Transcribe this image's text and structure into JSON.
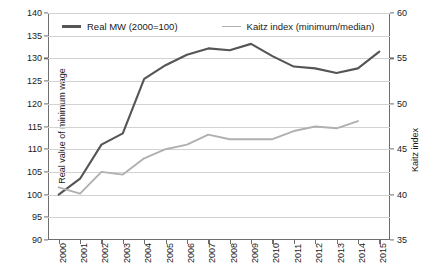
{
  "chart_data": {
    "type": "line",
    "title": "",
    "subtitle": "",
    "xlabel": "",
    "ylabel": "Real value of minimum wage",
    "y2label": "Kaitz index",
    "categories": [
      "2000",
      "2001",
      "2002",
      "2003",
      "2004",
      "2005",
      "2006",
      "2007",
      "2008",
      "2009",
      "2010",
      "2011",
      "2012",
      "2013",
      "2014",
      "2015"
    ],
    "x": [
      2000,
      2001,
      2002,
      2003,
      2004,
      2005,
      2006,
      2007,
      2008,
      2009,
      2010,
      2011,
      2012,
      2013,
      2014,
      2015
    ],
    "ylim": [
      90,
      140
    ],
    "y2lim": [
      35,
      60
    ],
    "yticks": [
      90,
      95,
      100,
      105,
      110,
      115,
      120,
      125,
      130,
      135,
      140
    ],
    "y2ticks": [
      35,
      40,
      45,
      50,
      55,
      60
    ],
    "grid": true,
    "legend_position": "top-inside",
    "series": [
      {
        "name": "Real MW (2000=100)",
        "axis": "left",
        "color": "#555555",
        "values": [
          100.0,
          103.5,
          111.0,
          113.5,
          125.5,
          128.5,
          130.8,
          132.2,
          131.8,
          133.2,
          130.5,
          128.2,
          127.8,
          126.8,
          127.8,
          131.5
        ]
      },
      {
        "name": "Kaitz index (minimum/median)",
        "axis": "right",
        "color": "#b0b0b0",
        "values": [
          40.8,
          40.1,
          42.5,
          42.2,
          44.0,
          45.0,
          45.5,
          46.6,
          46.1,
          46.1,
          46.1,
          47.0,
          47.5,
          47.3,
          48.1,
          null
        ]
      }
    ]
  },
  "legend": {
    "items": [
      {
        "label": "Real MW (2000=100)",
        "color": "#555555",
        "swatch": "thick-line-swatch"
      },
      {
        "label": "Kaitz index (minimum/median)",
        "color": "#b0b0b0",
        "swatch": "thin-line-swatch"
      }
    ]
  },
  "colors": {
    "real_mw_line": "#555555",
    "kaitz_line": "#b0b0b0",
    "gridline": "#d2d2d2",
    "axis": "#6e6e6e",
    "background": "#ffffff",
    "text": "#1a1a1a"
  }
}
